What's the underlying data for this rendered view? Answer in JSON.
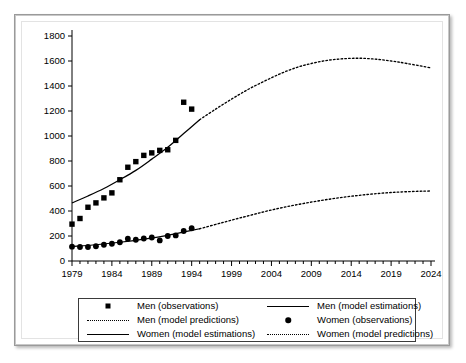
{
  "figure": {
    "background_color": "#ffffff",
    "frame_color": "#9a9a9a"
  },
  "chart_data": {
    "type": "scatter",
    "title": "",
    "xlabel": "",
    "ylabel": "",
    "xlim": [
      1979,
      2024
    ],
    "ylim": [
      0,
      1800
    ],
    "xticks": [
      1979,
      1984,
      1989,
      1994,
      1999,
      2004,
      2009,
      2014,
      2019,
      2024
    ],
    "xtick_labels": [
      "1979",
      "1984",
      "1989",
      "1994",
      "1999",
      "2004",
      "2009",
      "2014",
      "2019",
      "2024"
    ],
    "xminor_step": 1,
    "yticks": [
      0,
      200,
      400,
      600,
      800,
      1000,
      1200,
      1400,
      1600,
      1800
    ],
    "ytick_labels": [
      "0",
      "200",
      "400",
      "600",
      "800",
      "1000",
      "1200",
      "1400",
      "1600",
      "1800"
    ],
    "grid": false,
    "legend_position": "below-axes",
    "model_split_year": 1995,
    "series": [
      {
        "name": "Men (observations)",
        "type": "scatter",
        "marker": "square",
        "color": "#000000",
        "x": [
          1979,
          1980,
          1981,
          1982,
          1983,
          1984,
          1985,
          1986,
          1987,
          1988,
          1989,
          1990,
          1991,
          1992,
          1993,
          1994
        ],
        "values": [
          295,
          340,
          430,
          465,
          505,
          545,
          650,
          750,
          795,
          845,
          865,
          885,
          890,
          965,
          1270,
          1215
        ]
      },
      {
        "name": "Men (model estimations)",
        "type": "line",
        "style": "solid",
        "color": "#000000",
        "x": [
          1979,
          1981,
          1983,
          1985,
          1987,
          1989,
          1991,
          1993,
          1995
        ],
        "values": [
          465,
          520,
          580,
          650,
          725,
          815,
          910,
          1020,
          1130
        ]
      },
      {
        "name": "Men (model predictions)",
        "type": "line",
        "style": "dotted",
        "color": "#000000",
        "x": [
          1995,
          1997,
          1999,
          2001,
          2003,
          2005,
          2007,
          2009,
          2011,
          2013,
          2015,
          2017,
          2019,
          2021,
          2024
        ],
        "values": [
          1130,
          1215,
          1295,
          1370,
          1435,
          1495,
          1545,
          1580,
          1605,
          1618,
          1622,
          1615,
          1600,
          1580,
          1545
        ]
      },
      {
        "name": "Women (observations)",
        "type": "scatter",
        "marker": "circle",
        "color": "#000000",
        "x": [
          1979,
          1980,
          1981,
          1982,
          1983,
          1984,
          1985,
          1986,
          1987,
          1988,
          1989,
          1990,
          1991,
          1992,
          1993,
          1994
        ],
        "values": [
          115,
          112,
          112,
          118,
          130,
          138,
          150,
          178,
          170,
          180,
          188,
          165,
          200,
          205,
          240,
          262
        ]
      },
      {
        "name": "Women (model estimations)",
        "type": "line",
        "style": "solid",
        "color": "#000000",
        "x": [
          1979,
          1982,
          1985,
          1988,
          1991,
          1994,
          1995
        ],
        "values": [
          115,
          130,
          150,
          175,
          205,
          245,
          258
        ]
      },
      {
        "name": "Women (model predictions)",
        "type": "line",
        "style": "dotted",
        "color": "#000000",
        "x": [
          1995,
          1998,
          2001,
          2004,
          2007,
          2010,
          2013,
          2016,
          2019,
          2022,
          2024
        ],
        "values": [
          258,
          310,
          360,
          408,
          448,
          482,
          510,
          532,
          548,
          557,
          560
        ]
      }
    ]
  },
  "legend": {
    "entries": [
      {
        "label": "Men (observations)",
        "key": "square-marker"
      },
      {
        "label": "Men (model estimations)",
        "key": "solid-line"
      },
      {
        "label": "Men (model predictions)",
        "key": "dotted-line"
      },
      {
        "label": "Women (observations)",
        "key": "circle-marker"
      },
      {
        "label": "Women (model estimations)",
        "key": "solid-line"
      },
      {
        "label": "Women (model predictions)",
        "key": "dotted-line"
      }
    ]
  }
}
